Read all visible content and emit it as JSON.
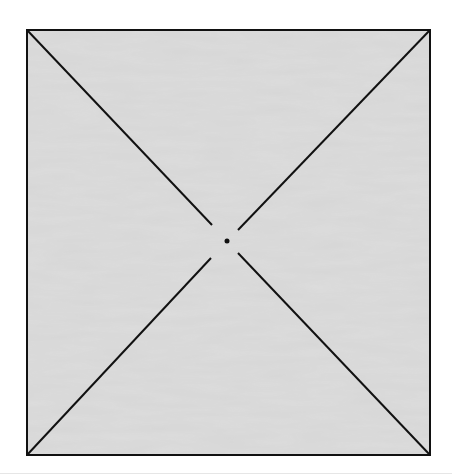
{
  "diagram": {
    "square": {
      "x1": 27,
      "y1": 30,
      "x2": 430,
      "y2": 455
    },
    "fill_color": "#d4d4d4",
    "stroke_color": "#111111",
    "center_dot": {
      "cx": 227,
      "cy": 241,
      "r": 2.5
    },
    "diagonal_gap_radius": 22
  }
}
